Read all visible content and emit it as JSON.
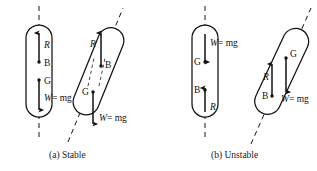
{
  "figure": {
    "panels": [
      {
        "id": "a",
        "caption": "(a) Stable",
        "description": "Centre of buoyancy B lies above centre of gravity G; righting couple restores upright position.",
        "bodies": [
          {
            "id": "a-upright",
            "state": "upright",
            "tilt_degrees": 0,
            "axis": "vertical-dashed-centerline",
            "labels": {
              "reaction": "R",
              "buoyancy_center": "B",
              "gravity_center": "G",
              "weight": "W",
              "weight_equals": "= mg"
            },
            "vectors": [
              {
                "name": "reaction-arrow",
                "symbol": "R",
                "direction": "up",
                "origin": "B"
              },
              {
                "name": "weight-arrow",
                "symbol": "W = mg",
                "direction": "down",
                "origin": "G"
              }
            ],
            "points_top_to_bottom": [
              "R",
              "B",
              "G",
              "W"
            ]
          },
          {
            "id": "a-tilted",
            "state": "tilted",
            "tilt_degrees": 22,
            "axis": "inclined-dashed-body-axis",
            "labels": {
              "reaction": "R",
              "buoyancy_center": "B",
              "gravity_center": "G",
              "weight": "W",
              "weight_equals": "= mg"
            },
            "vectors": [
              {
                "name": "reaction-arrow",
                "symbol": "R",
                "direction": "up",
                "origin": "B"
              },
              {
                "name": "weight-arrow",
                "symbol": "W = mg",
                "direction": "down",
                "origin": "G"
              }
            ],
            "points_top_to_bottom": [
              "R",
              "B",
              "G",
              "W"
            ]
          }
        ]
      },
      {
        "id": "b",
        "caption": "(b) Unstable",
        "description": "Centre of gravity G lies above centre of buoyancy B; overturning couple increases the tilt.",
        "bodies": [
          {
            "id": "b-upright",
            "state": "upright",
            "tilt_degrees": 0,
            "axis": "vertical-dashed-centerline",
            "labels": {
              "reaction": "R",
              "buoyancy_center": "B",
              "gravity_center": "G",
              "weight": "W",
              "weight_equals": "= mg"
            },
            "vectors": [
              {
                "name": "weight-arrow",
                "symbol": "W = mg",
                "direction": "down",
                "origin": "G"
              },
              {
                "name": "reaction-arrow",
                "symbol": "R",
                "direction": "up",
                "origin": "B"
              }
            ],
            "points_top_to_bottom": [
              "W",
              "G",
              "B",
              "R"
            ]
          },
          {
            "id": "b-tilted",
            "state": "tilted",
            "tilt_degrees": 25,
            "axis": "inclined-dashed-body-axis",
            "labels": {
              "reaction": "R",
              "buoyancy_center": "B",
              "gravity_center": "G",
              "weight": "W",
              "weight_equals": "= mg"
            },
            "vectors": [
              {
                "name": "reaction-arrow",
                "symbol": "R",
                "direction": "up",
                "origin": "B"
              },
              {
                "name": "weight-arrow",
                "symbol": "W = mg",
                "direction": "down",
                "origin": "G"
              }
            ],
            "points_top_to_bottom": [
              "G",
              "R",
              "B",
              "W"
            ]
          }
        ]
      }
    ],
    "colors": {
      "background": "#ffffff",
      "ink": "#121212",
      "dashed": "#2a2a2a"
    }
  }
}
